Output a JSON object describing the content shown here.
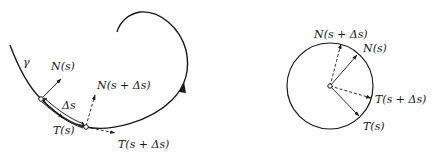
{
  "left_figure": {
    "curve_label": "γ",
    "labels": {
      "normal_s": "N(s)",
      "normal_s_ds": "N(s + Δs)",
      "delta_s": "Δs",
      "tangent_s": "T(s)",
      "tangent_s_ds": "T(s + Δs)"
    }
  },
  "right_figure": {
    "labels": {
      "normal_s_ds": "N(s + Δs)",
      "normal_s": "N(s)",
      "tangent_s_ds": "T(s + Δs)",
      "tangent_s": "T(s)"
    }
  },
  "colors": {
    "ink": "#1a1a1a",
    "background": "#fefefe"
  }
}
